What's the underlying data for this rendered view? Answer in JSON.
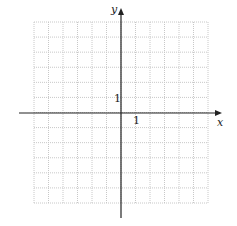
{
  "diagram": {
    "type": "coordinate-grid",
    "grid": {
      "left": 34,
      "top": 22,
      "right": 208,
      "bottom": 203,
      "cols": 12,
      "rows": 12,
      "color": "#c8c8c8"
    },
    "axes": {
      "origin_x": 121,
      "origin_y": 113,
      "x_start": 19,
      "x_end": 222,
      "y_start": 218,
      "y_end": 8,
      "color": "#222222"
    },
    "labels": {
      "x_axis": "x",
      "y_axis": "y",
      "x_unit": "1",
      "y_unit": "1"
    }
  }
}
